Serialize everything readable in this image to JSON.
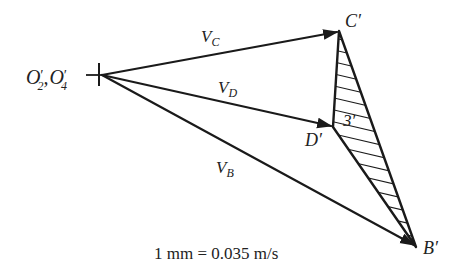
{
  "figure": {
    "type": "velocity-polygon",
    "points": {
      "origin": {
        "label": "O′₂,O′₄",
        "x": 102,
        "y": 75
      },
      "C": {
        "label": "C′",
        "x": 339,
        "y": 31
      },
      "D": {
        "label": "D′",
        "x": 333,
        "y": 127
      },
      "B": {
        "label": "B′",
        "x": 416,
        "y": 247
      }
    },
    "vectors": [
      {
        "name": "V_C",
        "label_main": "V",
        "label_sub": "C",
        "from": "origin",
        "to": "C"
      },
      {
        "name": "V_D",
        "label_main": "V",
        "label_sub": "D",
        "from": "origin",
        "to": "D"
      },
      {
        "name": "V_B",
        "label_main": "V",
        "label_sub": "B",
        "from": "origin",
        "to": "B"
      }
    ],
    "hatched_region": {
      "label": "3′",
      "vertices": [
        "C",
        "D",
        "B"
      ]
    },
    "scale_text": "1 mm = 0.035 m/s"
  },
  "labels": {
    "origin_O": "O",
    "origin_sub2": "2",
    "origin_sep": ",",
    "origin_sub4": "4",
    "prime": "′",
    "vc_main": "V",
    "vc_sub": "C",
    "vd_main": "V",
    "vd_sub": "D",
    "vb_main": "V",
    "vb_sub": "B",
    "c_point": "C′",
    "d_point": "D′",
    "b_point": "B′",
    "link3": "3′",
    "scale": "1 mm = 0.035 m/s"
  }
}
